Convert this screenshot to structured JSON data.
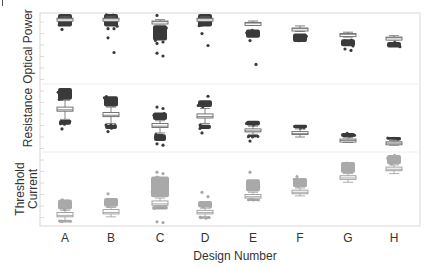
{
  "chart_data": {
    "type": "box",
    "title": "",
    "xlabel": "Design Number",
    "categories": [
      "A",
      "B",
      "C",
      "D",
      "E",
      "F",
      "G",
      "H"
    ],
    "panels": [
      {
        "name": "Optical Power",
        "ylabel": "Optical Power",
        "color": "#3a3a3a",
        "boxes": [
          {
            "cat": "A",
            "q1": 0.92,
            "med": 0.93,
            "q3": 0.94,
            "wlo": 0.9,
            "whi": 0.96,
            "cluster": [
              0.82,
              1.0
            ],
            "outliers": [
              0.78
            ]
          },
          {
            "cat": "B",
            "q1": 0.92,
            "med": 0.93,
            "q3": 0.94,
            "wlo": 0.9,
            "whi": 0.96,
            "cluster": [
              0.82,
              1.0
            ],
            "outliers": [
              0.79,
              0.79,
              0.66,
              0.45
            ]
          },
          {
            "cat": "C",
            "q1": 0.88,
            "med": 0.89,
            "q3": 0.9,
            "wlo": 0.86,
            "whi": 0.92,
            "cluster": [
              0.62,
              0.84
            ],
            "outliers": [
              0.58,
              0.6,
              0.44,
              0.4,
              0.98
            ]
          },
          {
            "cat": "D",
            "q1": 0.92,
            "med": 0.93,
            "q3": 0.94,
            "wlo": 0.9,
            "whi": 0.96,
            "cluster": [
              0.82,
              1.0
            ],
            "outliers": [
              0.72,
              0.55
            ]
          },
          {
            "cat": "E",
            "q1": 0.86,
            "med": 0.87,
            "q3": 0.88,
            "wlo": 0.84,
            "whi": 0.9,
            "cluster": [
              0.66,
              0.78
            ],
            "outliers": [
              0.62,
              0.28
            ]
          },
          {
            "cat": "F",
            "q1": 0.78,
            "med": 0.79,
            "q3": 0.8,
            "wlo": 0.75,
            "whi": 0.83,
            "cluster": [
              0.6,
              0.72
            ],
            "outliers": []
          },
          {
            "cat": "G",
            "q1": 0.7,
            "med": 0.71,
            "q3": 0.72,
            "wlo": 0.67,
            "whi": 0.74,
            "cluster": [
              0.54,
              0.64
            ],
            "outliers": [
              0.5,
              0.48
            ]
          },
          {
            "cat": "H",
            "q1": 0.65,
            "med": 0.66,
            "q3": 0.67,
            "wlo": 0.63,
            "whi": 0.69,
            "cluster": [
              0.52,
              0.6
            ],
            "outliers": []
          }
        ]
      },
      {
        "name": "Resistance",
        "ylabel": "Resistance",
        "color": "#3a3a3a",
        "boxes": [
          {
            "cat": "A",
            "q1": 0.6,
            "med": 0.62,
            "q3": 0.66,
            "wlo": 0.48,
            "whi": 0.76,
            "cluster": [
              0.77,
              0.94
            ],
            "lowcluster": [
              0.4,
              0.47
            ],
            "outliers": [
              0.34
            ]
          },
          {
            "cat": "B",
            "q1": 0.52,
            "med": 0.54,
            "q3": 0.58,
            "wlo": 0.42,
            "whi": 0.66,
            "cluster": [
              0.67,
              0.82
            ],
            "lowcluster": [
              0.34,
              0.4
            ],
            "outliers": [
              0.3
            ]
          },
          {
            "cat": "C",
            "q1": 0.36,
            "med": 0.38,
            "q3": 0.42,
            "wlo": 0.28,
            "whi": 0.46,
            "cluster": [
              0.47,
              0.58
            ],
            "lowcluster": [
              0.16,
              0.26
            ],
            "outliers": [
              0.66,
              0.64,
              0.12,
              0.1
            ]
          },
          {
            "cat": "D",
            "q1": 0.5,
            "med": 0.52,
            "q3": 0.56,
            "wlo": 0.42,
            "whi": 0.64,
            "cluster": [
              0.66,
              0.76
            ],
            "lowcluster": [
              0.34,
              0.4
            ],
            "outliers": [
              0.28,
              0.82
            ]
          },
          {
            "cat": "E",
            "q1": 0.3,
            "med": 0.31,
            "q3": 0.34,
            "wlo": 0.26,
            "whi": 0.38,
            "cluster": [
              0.39,
              0.46
            ],
            "lowcluster": [
              0.22,
              0.25
            ],
            "outliers": [
              0.16
            ]
          },
          {
            "cat": "F",
            "q1": 0.26,
            "med": 0.27,
            "q3": 0.3,
            "wlo": 0.22,
            "whi": 0.34,
            "cluster": [
              0.35,
              0.4
            ],
            "lowcluster": [],
            "outliers": []
          },
          {
            "cat": "G",
            "q1": 0.16,
            "med": 0.17,
            "q3": 0.19,
            "wlo": 0.14,
            "whi": 0.21,
            "cluster": [
              0.22,
              0.28
            ],
            "lowcluster": [],
            "outliers": []
          },
          {
            "cat": "H",
            "q1": 0.12,
            "med": 0.13,
            "q3": 0.15,
            "wlo": 0.1,
            "whi": 0.17,
            "cluster": [
              0.18,
              0.22
            ],
            "lowcluster": [],
            "outliers": []
          }
        ]
      },
      {
        "name": "Threshold Current",
        "ylabel": "Threshold Current",
        "color": "#a9a9a9",
        "boxes": [
          {
            "cat": "A",
            "q1": 0.1,
            "med": 0.12,
            "q3": 0.16,
            "wlo": 0.05,
            "whi": 0.19,
            "cluster": [
              0.2,
              0.34
            ],
            "lowcluster": [
              0.03,
              0.05
            ],
            "outliers": []
          },
          {
            "cat": "B",
            "q1": 0.14,
            "med": 0.16,
            "q3": 0.2,
            "wlo": 0.1,
            "whi": 0.23,
            "cluster": [
              0.24,
              0.36
            ],
            "lowcluster": [],
            "outliers": [
              0.42
            ]
          },
          {
            "cat": "C",
            "q1": 0.26,
            "med": 0.28,
            "q3": 0.32,
            "wlo": 0.22,
            "whi": 0.36,
            "cluster": [
              0.37,
              0.66
            ],
            "lowcluster": [
              0.2,
              0.25
            ],
            "outliers": [
              0.72,
              0.7,
              0.64,
              0.02,
              0.03
            ]
          },
          {
            "cat": "D",
            "q1": 0.14,
            "med": 0.16,
            "q3": 0.19,
            "wlo": 0.1,
            "whi": 0.22,
            "cluster": [
              0.23,
              0.32
            ],
            "lowcluster": [
              0.08,
              0.1
            ],
            "outliers": [
              0.44,
              0.38
            ]
          },
          {
            "cat": "E",
            "q1": 0.36,
            "med": 0.38,
            "q3": 0.41,
            "wlo": 0.33,
            "whi": 0.44,
            "cluster": [
              0.45,
              0.62
            ],
            "lowcluster": [
              0.32,
              0.35
            ],
            "outliers": [
              0.72
            ]
          },
          {
            "cat": "F",
            "q1": 0.42,
            "med": 0.44,
            "q3": 0.47,
            "wlo": 0.39,
            "whi": 0.5,
            "cluster": [
              0.51,
              0.64
            ],
            "lowcluster": [],
            "outliers": [
              0.66
            ]
          },
          {
            "cat": "G",
            "q1": 0.62,
            "med": 0.64,
            "q3": 0.67,
            "wlo": 0.58,
            "whi": 0.7,
            "cluster": [
              0.71,
              0.86
            ],
            "lowcluster": [],
            "outliers": []
          },
          {
            "cat": "H",
            "q1": 0.74,
            "med": 0.76,
            "q3": 0.79,
            "wlo": 0.7,
            "whi": 0.82,
            "cluster": [
              0.83,
              0.96
            ],
            "lowcluster": [],
            "outliers": []
          }
        ]
      }
    ],
    "grid": false,
    "legend": "none"
  },
  "labels": {
    "xlabel": "Design Number",
    "ylabels": [
      "Optical Power",
      "Resistance",
      "Threshold",
      "Current"
    ],
    "xticks": [
      "A",
      "B",
      "C",
      "D",
      "E",
      "F",
      "G",
      "H"
    ]
  }
}
